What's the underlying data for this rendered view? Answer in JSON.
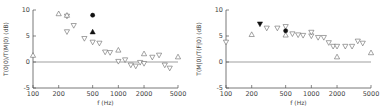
{
  "chart_data": [
    {
      "type": "scatter",
      "title": "",
      "xlabel": "f (Hz)",
      "ylabel": "T(0|0)/T(M|0) (dB)",
      "xscale": "log",
      "xlim": [
        100,
        5000
      ],
      "ylim": [
        -5,
        10
      ],
      "xticks": [
        100,
        200,
        500,
        1000,
        2000,
        5000
      ],
      "xtick_labels": [
        "100",
        "200",
        "500",
        "1000",
        "2000",
        "5000"
      ],
      "yticks": [
        -5,
        0,
        5,
        10
      ],
      "ytick_labels": [
        "-5",
        "0",
        "5",
        "10"
      ],
      "zero_line": true,
      "series": [
        {
          "name": "open-down-triangle",
          "marker": "triangle-down",
          "filled": false,
          "points": [
            [
              250,
              8.8
            ],
            [
              250,
              5.8
            ],
            [
              300,
              7.0
            ],
            [
              400,
              4.5
            ],
            [
              500,
              3.8
            ],
            [
              600,
              3.6
            ],
            [
              700,
              1.9
            ],
            [
              800,
              1.8
            ],
            [
              1000,
              0.1
            ],
            [
              1200,
              0.4
            ],
            [
              1400,
              -0.6
            ],
            [
              1600,
              -0.8
            ],
            [
              1800,
              -0.1
            ],
            [
              2000,
              -0.3
            ],
            [
              2500,
              0.9
            ],
            [
              3000,
              1.3
            ],
            [
              3500,
              -0.6
            ],
            [
              4000,
              -1.2
            ]
          ]
        },
        {
          "name": "open-up-triangle",
          "marker": "triangle-up",
          "filled": false,
          "points": [
            [
              100,
              1.3
            ],
            [
              200,
              9.3
            ],
            [
              250,
              9.0
            ],
            [
              1000,
              2.3
            ],
            [
              2000,
              1.6
            ],
            [
              5000,
              1.0
            ]
          ]
        },
        {
          "name": "filled-circle",
          "marker": "circle",
          "filled": true,
          "points": [
            [
              500,
              9.0
            ]
          ]
        },
        {
          "name": "filled-up-triangle",
          "marker": "triangle-up",
          "filled": true,
          "points": [
            [
              500,
              5.8
            ]
          ]
        }
      ]
    },
    {
      "type": "scatter",
      "title": "",
      "xlabel": "f (Hz)",
      "ylabel": "T(M|0)/T(F|0) (dB)",
      "xscale": "log",
      "xlim": [
        100,
        5000
      ],
      "ylim": [
        -5,
        10
      ],
      "xticks": [
        100,
        200,
        500,
        1000,
        2000,
        5000
      ],
      "xtick_labels": [
        "100",
        "200",
        "500",
        "1000",
        "2000",
        "5000"
      ],
      "yticks": [
        -5,
        0,
        5,
        10
      ],
      "ytick_labels": [
        "-5",
        "0",
        "5",
        "10"
      ],
      "zero_line": true,
      "series": [
        {
          "name": "open-down-triangle",
          "marker": "triangle-down",
          "filled": false,
          "points": [
            [
              100,
              3.8
            ],
            [
              300,
              6.5
            ],
            [
              400,
              6.5
            ],
            [
              500,
              6.8
            ],
            [
              600,
              5.4
            ],
            [
              700,
              5.2
            ],
            [
              800,
              5.1
            ],
            [
              1000,
              5.0
            ],
            [
              1000,
              5.7
            ],
            [
              1200,
              4.7
            ],
            [
              1400,
              4.7
            ],
            [
              1600,
              3.7
            ],
            [
              1800,
              3.0
            ],
            [
              2000,
              3.0
            ],
            [
              2500,
              3.0
            ],
            [
              3000,
              3.0
            ],
            [
              3500,
              4.0
            ],
            [
              4000,
              3.6
            ]
          ]
        },
        {
          "name": "open-up-triangle",
          "marker": "triangle-up",
          "filled": false,
          "points": [
            [
              200,
              5.3
            ],
            [
              500,
              5.2
            ],
            [
              2000,
              1.0
            ],
            [
              5000,
              1.8
            ]
          ]
        },
        {
          "name": "filled-down-triangle",
          "marker": "triangle-down",
          "filled": true,
          "points": [
            [
              250,
              7.3
            ]
          ]
        },
        {
          "name": "filled-circle",
          "marker": "circle",
          "filled": true,
          "points": [
            [
              500,
              6.0
            ]
          ]
        }
      ]
    }
  ]
}
